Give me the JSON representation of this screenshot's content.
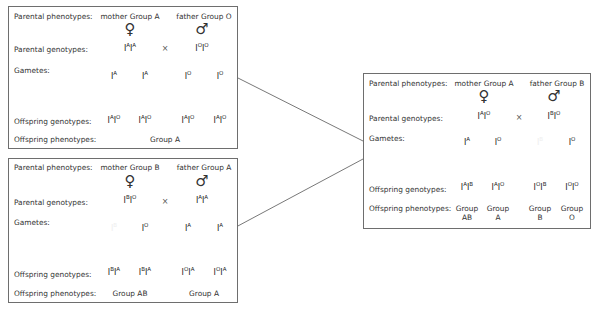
{
  "row_labels": {
    "parental_phenotypes": "Parental phenotypes:",
    "parental_genotypes": "Parental genotypes:",
    "gametes": "Gametes:",
    "offspring_genotypes": "Offspring genotypes:",
    "offspring_phenotypes": "Offspring phenotypes:"
  },
  "symbols": {
    "female": "♀",
    "male": "♂",
    "cross": "×"
  },
  "colors": {
    "allele_A": "#c6c6c6",
    "allele_O": "#8c8c8c",
    "allele_B": "#474747",
    "border": "#6e6e6e"
  },
  "crosses": [
    {
      "id": "top-left",
      "mother_phenotype": "mother Group A",
      "father_phenotype": "father Group O",
      "mother_genotype": [
        "A",
        "A"
      ],
      "father_genotype": [
        "O",
        "O"
      ],
      "gametes": [
        "A",
        "A",
        "O",
        "O"
      ],
      "offspring_genotypes": [
        [
          "A",
          "O"
        ],
        [
          "A",
          "O"
        ],
        [
          "A",
          "O"
        ],
        [
          "A",
          "O"
        ]
      ],
      "offspring_phenotypes": [
        "Group A"
      ]
    },
    {
      "id": "bottom-left",
      "mother_phenotype": "mother Group B",
      "father_phenotype": "father Group A",
      "mother_genotype": [
        "B",
        "O"
      ],
      "father_genotype": [
        "A",
        "A"
      ],
      "gametes": [
        "B",
        "O",
        "A",
        "A"
      ],
      "offspring_genotypes": [
        [
          "B",
          "A"
        ],
        [
          "B",
          "A"
        ],
        [
          "O",
          "A"
        ],
        [
          "O",
          "A"
        ]
      ],
      "offspring_phenotypes": [
        "Group AB",
        "Group A"
      ]
    },
    {
      "id": "right",
      "mother_phenotype": "mother Group A",
      "father_phenotype": "father Group B",
      "mother_genotype": [
        "A",
        "O"
      ],
      "father_genotype": [
        "B",
        "O"
      ],
      "gametes": [
        "A",
        "O",
        "B",
        "O"
      ],
      "offspring_genotypes": [
        [
          "A",
          "B"
        ],
        [
          "A",
          "O"
        ],
        [
          "O",
          "B"
        ],
        [
          "O",
          "O"
        ]
      ],
      "offspring_phenotypes": [
        [
          "Group",
          "AB"
        ],
        [
          "Group",
          "A"
        ],
        [
          "Group",
          "B"
        ],
        [
          "Group",
          "O"
        ]
      ]
    }
  ]
}
